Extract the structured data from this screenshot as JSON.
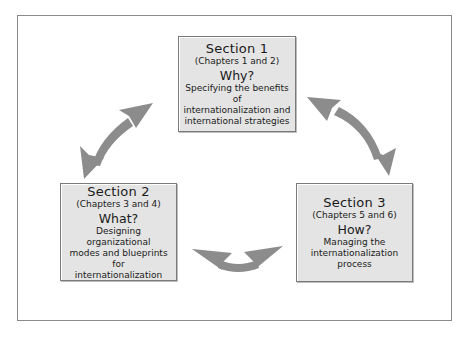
{
  "diagram": {
    "arrow_color": "#8c8c8c",
    "box_fill": "#e4e4e4",
    "box_border": "#7a7a7a",
    "sections": [
      {
        "title": "Section 1",
        "chapters": "(Chapters 1 and 2)",
        "question": "Why?",
        "description": "Specifying the benefits of\ninternationalization and\ninternational strategies"
      },
      {
        "title": "Section 2",
        "chapters": "(Chapters 3 and 4)",
        "question": "What?",
        "description": "Designing organizational\nmodes and blueprints for\ninternationalization"
      },
      {
        "title": "Section 3",
        "chapters": "(Chapters 5 and 6)",
        "question": "How?",
        "description": "Managing the\ninternationalization\nprocess"
      }
    ],
    "connections": [
      {
        "from": "Section 1",
        "to": "Section 2",
        "type": "bidirectional-arrow"
      },
      {
        "from": "Section 1",
        "to": "Section 3",
        "type": "bidirectional-arrow"
      },
      {
        "from": "Section 2",
        "to": "Section 3",
        "type": "bidirectional-arrow"
      }
    ]
  }
}
